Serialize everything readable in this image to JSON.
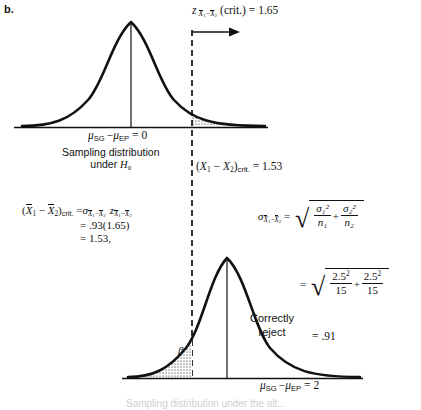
{
  "figure": {
    "panel_label": "b.",
    "top_curve": {
      "critical_z_label": "z x̄₁−x̄₂ (crit.) = 1.65",
      "mean_label": "μSG − μEP = 0",
      "caption_line1": "Sampling distribution",
      "caption_line2": "under H₀",
      "critical_value_label": "(X₁ − X₂)crit. = 1.53",
      "shaded_region": "alpha"
    },
    "bottom_curve": {
      "mean_label": "μSG − μEP = 2",
      "correctly_reject_line1": "Correctly",
      "correctly_reject_line2": "reject",
      "beta_label": "β",
      "cut_caption": "Sampling distribution under the alt..."
    },
    "equation_left": {
      "line1_lhs": "(X̄₁ − X̄₂)crit.",
      "line1_rhs": "= σx̄₁−x̄₂ z x̄₁−x̄₂",
      "line2": "= .93(1.65)",
      "line3": "= 1.53,"
    },
    "equation_right": {
      "lhs": "σ x̄₁−x̄₂",
      "rhs": "= √( σ₁²/n₁ + σ₂²/n₂ )",
      "numeric": "= √( 2.5²/15 + 2.5²/15 )",
      "result": "= .91",
      "sigma1_sq": "σ₁²",
      "sigma2_sq": "σ₂²",
      "n1": "n₁",
      "n2": "n₂",
      "val_num1": "2.5",
      "val_num2": "2.5",
      "val_den1": "15",
      "val_den2": "15",
      "exp": "2",
      "result_value": ".91"
    },
    "symbols": {
      "sigma": "σ",
      "mu": "μ",
      "beta": "β",
      "z": "z",
      "eq": "=",
      "minus": "−",
      "plus": "+",
      "radical": "√",
      "x": "X",
      "sub_SG": "SG",
      "sub_EP": "EP",
      "sub_1": "1",
      "sub_2": "2",
      "crit": "crit.",
      "crit_paren": "(crit.)",
      "H": "H",
      "zero": "0",
      "two": "2",
      "v165": "1.65",
      "v153": "1.53",
      "v93": ".93",
      "open_paren": "(",
      "close_paren": ")"
    },
    "colors": {
      "ink": "#111111",
      "shade": "#b9b9b9",
      "paper": "#ffffff"
    }
  }
}
